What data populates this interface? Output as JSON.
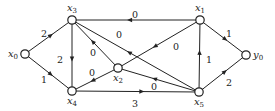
{
  "diagram": {
    "type": "directed-weighted-graph",
    "colors": {
      "stroke": "#222222",
      "node_fill": "#ffffff",
      "text": "#222222",
      "background": "#ffffff"
    },
    "nodes": [
      {
        "id": "x0",
        "label": "x",
        "sub": "0",
        "x": 25,
        "y": 54,
        "label_pos": "left"
      },
      {
        "id": "x3",
        "label": "x",
        "sub": "3",
        "x": 72,
        "y": 20,
        "label_pos": "top"
      },
      {
        "id": "x4",
        "label": "x",
        "sub": "4",
        "x": 72,
        "y": 91,
        "label_pos": "bottom"
      },
      {
        "id": "x2",
        "label": "x",
        "sub": "2",
        "x": 118,
        "y": 68,
        "label_pos": "bottom"
      },
      {
        "id": "x1",
        "label": "x",
        "sub": "1",
        "x": 200,
        "y": 20,
        "label_pos": "top"
      },
      {
        "id": "x5",
        "label": "x",
        "sub": "5",
        "x": 199,
        "y": 92,
        "label_pos": "bottom"
      },
      {
        "id": "y0",
        "label": "y",
        "sub": "0",
        "x": 246,
        "y": 55,
        "label_pos": "right"
      }
    ],
    "edges": [
      {
        "from": "x0",
        "to": "x3",
        "weight": "2",
        "lx": 44,
        "ly": 34
      },
      {
        "from": "x0",
        "to": "x4",
        "weight": "1",
        "lx": 44,
        "ly": 80
      },
      {
        "from": "x3",
        "to": "x4",
        "weight": "2",
        "lx": 60,
        "ly": 60
      },
      {
        "from": "x1",
        "to": "x3",
        "weight": "0",
        "lx": 135,
        "ly": 15
      },
      {
        "from": "x5",
        "to": "x3",
        "weight": "0",
        "lx": 119,
        "ly": 35
      },
      {
        "from": "x2",
        "to": "x3",
        "weight": "0",
        "lx": 93,
        "ly": 53
      },
      {
        "from": "x1",
        "to": "x2",
        "weight": "0",
        "lx": 176,
        "ly": 47
      },
      {
        "from": "x2",
        "to": "x4",
        "weight": "0",
        "lx": 92,
        "ly": 73
      },
      {
        "from": "x5",
        "to": "x2",
        "weight": "0",
        "lx": 154,
        "ly": 87
      },
      {
        "from": "x4",
        "to": "x5",
        "weight": "3",
        "lx": 135,
        "ly": 104
      },
      {
        "from": "x5",
        "to": "x1",
        "weight": "1",
        "lx": 209,
        "ly": 60
      },
      {
        "from": "x1",
        "to": "y0",
        "weight": "1",
        "lx": 229,
        "ly": 34
      },
      {
        "from": "x5",
        "to": "y0",
        "weight": "2",
        "lx": 229,
        "ly": 83
      }
    ]
  }
}
